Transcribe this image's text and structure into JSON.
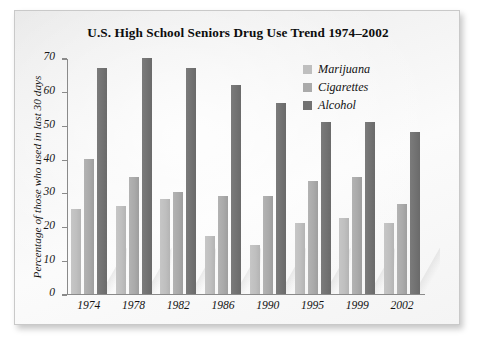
{
  "chart_data": {
    "type": "bar",
    "title": "U.S. High School Seniors Drug Use Trend 1974–2002",
    "xlabel": "",
    "ylabel": "Percentage of those who used in last 30 days",
    "ylim": [
      0,
      70
    ],
    "ytick_step": 10,
    "yticks": [
      0,
      10,
      20,
      30,
      40,
      50,
      60,
      70
    ],
    "grid": false,
    "legend_position": "top-right",
    "categories": [
      "1974",
      "1978",
      "1982",
      "1986",
      "1990",
      "1995",
      "1999",
      "2002"
    ],
    "series": [
      {
        "name": "Marijuana",
        "color": "#bfbfbf",
        "values": [
          25,
          26,
          28,
          17,
          14.5,
          21,
          22.5,
          21
        ]
      },
      {
        "name": "Cigarettes",
        "color": "#aaaaaa",
        "values": [
          40,
          34.5,
          30,
          29,
          29,
          33.5,
          34.5,
          26.5
        ]
      },
      {
        "name": "Alcohol",
        "color": "#727272",
        "values": [
          67,
          70,
          67,
          62,
          56.5,
          51,
          51,
          48
        ]
      }
    ]
  }
}
